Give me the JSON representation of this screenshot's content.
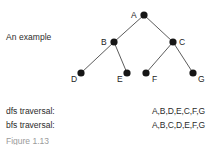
{
  "figure": {
    "caption_left": "An example",
    "bottom_caption_clipped": "Figure 1.13"
  },
  "tree": {
    "nodes": [
      {
        "id": "A",
        "label": "A",
        "x": 144,
        "y": 15,
        "label_x": 131,
        "label_y": 18,
        "r": 3.6
      },
      {
        "id": "B",
        "label": "B",
        "x": 114,
        "y": 42,
        "label_x": 101,
        "label_y": 45,
        "r": 3.6
      },
      {
        "id": "C",
        "label": "C",
        "x": 173,
        "y": 42,
        "label_x": 179,
        "label_y": 45,
        "r": 3.6
      },
      {
        "id": "D",
        "label": "D",
        "x": 81,
        "y": 73,
        "label_x": 71,
        "label_y": 82,
        "r": 3.6
      },
      {
        "id": "E",
        "label": "E",
        "x": 127,
        "y": 73,
        "label_x": 117,
        "label_y": 82,
        "r": 3.6
      },
      {
        "id": "F",
        "label": "F",
        "x": 146,
        "y": 73,
        "label_x": 152,
        "label_y": 82,
        "r": 3.6
      },
      {
        "id": "G",
        "label": "G",
        "x": 193,
        "y": 73,
        "label_x": 198,
        "label_y": 82,
        "r": 3.6
      }
    ],
    "edges": [
      {
        "from": "A",
        "to": "B"
      },
      {
        "from": "A",
        "to": "C"
      },
      {
        "from": "B",
        "to": "D"
      },
      {
        "from": "B",
        "to": "E"
      },
      {
        "from": "C",
        "to": "F"
      },
      {
        "from": "C",
        "to": "G"
      }
    ],
    "node_color": "#161616",
    "edge_color": "#4a4a4a"
  },
  "traversals": [
    {
      "label": "dfs traversal:",
      "value": "A,B,D,E,C,F,G"
    },
    {
      "label": "bfs traversal:",
      "value": "A,B,C,D,E,F,G"
    }
  ]
}
